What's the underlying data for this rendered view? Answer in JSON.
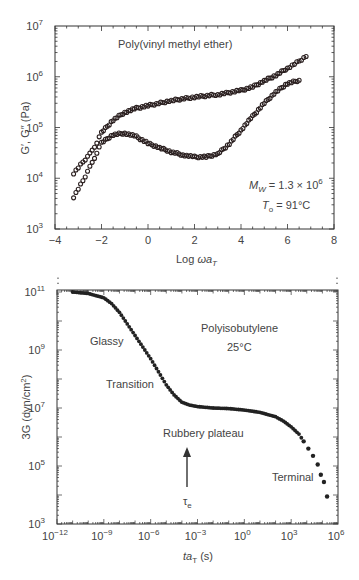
{
  "chart_data": [
    {
      "type": "scatter",
      "title": "Poly(vinyl methyl ether)",
      "xlabel": "Log ωa_T",
      "ylabel": "G′, G″ (Pa)",
      "xlim": [
        -4,
        8
      ],
      "ylim_log10": [
        3,
        7
      ],
      "y_scale": "log",
      "grid": false,
      "x_ticks": [
        "−4",
        "−2",
        "0",
        "2",
        "4",
        "6",
        "8"
      ],
      "y_ticks": [
        "10^3",
        "10^4",
        "10^5",
        "10^6",
        "10^7"
      ],
      "annotations": [
        "M_W = 1.3 × 10^6",
        "T_0 = 91°C"
      ],
      "series": [
        {
          "name": "G′",
          "marker": "open circle",
          "x": [
            -3.2,
            -2.8,
            -2.5,
            -2.2,
            -2.0,
            -1.5,
            -1.0,
            -0.5,
            0,
            1,
            2,
            3,
            4,
            4.5,
            5,
            5.5,
            6,
            6.4,
            6.8
          ],
          "log10_y": [
            4.1,
            4.32,
            4.48,
            4.7,
            4.9,
            5.15,
            5.3,
            5.38,
            5.43,
            5.53,
            5.6,
            5.65,
            5.73,
            5.8,
            5.92,
            6.03,
            6.17,
            6.28,
            6.4
          ]
        },
        {
          "name": "G″",
          "marker": "open circle",
          "x": [
            -3.2,
            -2.8,
            -2.5,
            -2.2,
            -2.0,
            -1.5,
            -1.0,
            -0.5,
            0,
            0.5,
            1,
            1.5,
            2,
            2.5,
            3,
            3.5,
            4,
            4.5,
            5,
            5.5,
            6,
            6.5
          ],
          "log10_y": [
            3.63,
            3.95,
            4.22,
            4.5,
            4.7,
            4.86,
            4.89,
            4.82,
            4.69,
            4.6,
            4.52,
            4.46,
            4.42,
            4.42,
            4.48,
            4.68,
            4.95,
            5.22,
            5.48,
            5.7,
            5.87,
            5.93
          ]
        }
      ]
    },
    {
      "type": "scatter",
      "title": "Polyisobutylene",
      "subtitle": "25°C",
      "xlabel": "ta_T (s)",
      "ylabel": "3G (dyn/cm²)",
      "x_scale": "log",
      "y_scale": "log",
      "xlim_log10": [
        -12,
        6
      ],
      "ylim_log10": [
        3,
        11.6
      ],
      "grid": false,
      "x_ticks": [
        "10^−12",
        "10^−9",
        "10^−6",
        "10^−3",
        "10^0",
        "10^3",
        "10^6"
      ],
      "y_ticks": [
        "10^3",
        "10^5",
        "10^7",
        "10^9",
        "10^11"
      ],
      "annotations": [
        "Glassy",
        "Transition",
        "Rubbery plateau",
        "Terminal",
        "τ_e (arrow at t ≈ 10^−3.7 s)"
      ],
      "series": [
        {
          "name": "3G",
          "marker": "filled circle",
          "log10_x": [
            -11,
            -10,
            -9,
            -8.5,
            -8,
            -7.5,
            -7,
            -6.5,
            -6,
            -5.5,
            -5,
            -4.5,
            -4,
            -3.5,
            -3,
            -2,
            -1,
            0,
            1,
            2,
            2.5,
            3,
            3.5,
            3.8,
            4.1,
            4.4,
            4.7,
            4.9,
            5.1,
            5.3
          ],
          "log10_y": [
            11.0,
            10.95,
            10.8,
            10.6,
            10.3,
            9.9,
            9.5,
            9.1,
            8.7,
            8.25,
            7.8,
            7.45,
            7.2,
            7.1,
            7.05,
            7.0,
            6.98,
            6.93,
            6.85,
            6.7,
            6.55,
            6.35,
            6.1,
            5.85,
            5.6,
            5.35,
            5.05,
            4.7,
            4.45,
            3.95
          ]
        }
      ]
    }
  ],
  "top": {
    "title": "Poly(vinyl methyl ether)",
    "xlabel_main": "Log ",
    "xlabel_omega": "ωa",
    "xlabel_sub": "T",
    "ylabel": "G′, G″ (Pa)",
    "mw_label": "M",
    "mw_sub": "W",
    "mw_value": " = 1.3 × 10",
    "mw_exp": "6",
    "t0_label": "T",
    "t0_sub": "o",
    "t0_value": " = 91°C",
    "xticks": [
      "−4",
      "−2",
      "0",
      "2",
      "4",
      "6",
      "8"
    ],
    "yticks_exp": [
      "3",
      "4",
      "5",
      "6",
      "7"
    ]
  },
  "bottom": {
    "title": "Polyisobutylene",
    "temp": "25°C",
    "glassy": "Glassy",
    "transition": "Transition",
    "rubbery": "Rubbery plateau",
    "terminal": "Terminal",
    "tau": "τ",
    "tau_sub": "e",
    "xlabel_main": "ta",
    "xlabel_sub": "T",
    "xlabel_unit": " (s)",
    "ylabel": "3G (dyn/cm",
    "ylabel_exp": "2",
    "ylabel_end": ")",
    "xticks_exp": [
      "−12",
      "−9",
      "−6",
      "−3",
      "0",
      "3",
      "6"
    ],
    "yticks_exp": [
      "3",
      "5",
      "7",
      "9",
      "11"
    ]
  }
}
